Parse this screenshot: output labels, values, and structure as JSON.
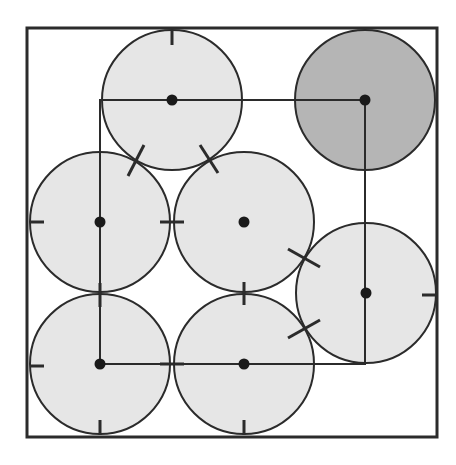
{
  "diagram": {
    "title": "",
    "container": {
      "x": 27,
      "y": 28,
      "width": 410,
      "height": 409,
      "stroke": "#2b2b2b",
      "stroke_width": 3
    },
    "colors": {
      "circle_fill": "#e6e6e6",
      "highlight_fill": "#b5b5b5",
      "stroke": "#2b2b2b",
      "dot": "#1a1a1a"
    },
    "radius": 70,
    "circles": [
      {
        "id": "top",
        "cx": 172,
        "cy": 100,
        "highlight": false
      },
      {
        "id": "top-right",
        "cx": 365,
        "cy": 100,
        "highlight": true
      },
      {
        "id": "mid-left",
        "cx": 100,
        "cy": 222,
        "highlight": false
      },
      {
        "id": "center",
        "cx": 244,
        "cy": 222,
        "highlight": false
      },
      {
        "id": "right",
        "cx": 366,
        "cy": 293,
        "highlight": false
      },
      {
        "id": "bottom-left",
        "cx": 100,
        "cy": 364,
        "highlight": false
      },
      {
        "id": "bottom-mid",
        "cx": 244,
        "cy": 364,
        "highlight": false
      }
    ],
    "path_rectangle": {
      "x1": 100,
      "y1": 100,
      "x2": 365,
      "y2": 364
    },
    "tick_marks": [
      {
        "x1": 172,
        "y1": 31,
        "x2": 172,
        "y2": 45
      },
      {
        "x1": 128,
        "y1": 176,
        "x2": 144,
        "y2": 145
      },
      {
        "x1": 200,
        "y1": 145,
        "x2": 218,
        "y2": 173
      },
      {
        "x1": 30,
        "y1": 222,
        "x2": 44,
        "y2": 222
      },
      {
        "x1": 160,
        "y1": 222,
        "x2": 184,
        "y2": 222
      },
      {
        "x1": 288,
        "y1": 249,
        "x2": 320,
        "y2": 267
      },
      {
        "x1": 288,
        "y1": 338,
        "x2": 320,
        "y2": 320
      },
      {
        "x1": 422,
        "y1": 295,
        "x2": 436,
        "y2": 295
      },
      {
        "x1": 244,
        "y1": 282,
        "x2": 244,
        "y2": 305
      },
      {
        "x1": 100,
        "y1": 283,
        "x2": 100,
        "y2": 307
      },
      {
        "x1": 30,
        "y1": 366,
        "x2": 44,
        "y2": 366
      },
      {
        "x1": 160,
        "y1": 364,
        "x2": 184,
        "y2": 364
      },
      {
        "x1": 100,
        "y1": 420,
        "x2": 100,
        "y2": 435
      },
      {
        "x1": 244,
        "y1": 420,
        "x2": 244,
        "y2": 435
      }
    ]
  }
}
